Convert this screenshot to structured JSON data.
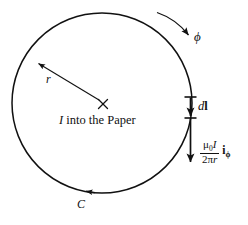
{
  "figure": {
    "background_color": "#ffffff",
    "stroke_color": "#111111",
    "labels": {
      "radius": "r",
      "phi": "ϕ",
      "contour": "C",
      "current_text_symbol": "I",
      "current_text_rest": " into the Paper",
      "dl_d": "d",
      "dl_l": "l",
      "formula_numerator_mu": "μ",
      "formula_numerator_mu_sub": "0",
      "formula_numerator_I": "I",
      "formula_denominator_two": "2",
      "formula_denominator_pi": "π",
      "formula_denominator_r": "r",
      "formula_unitvector": "i",
      "formula_unitvector_sub": "ϕ"
    },
    "geometry": {
      "circle_center_x": 102,
      "circle_center_y": 103,
      "circle_radius": 90,
      "center_cross_x": 103,
      "center_cross_y": 104,
      "radius_arrow_tip_x": 38,
      "radius_arrow_tip_y": 63,
      "dl_segment_top_y": 97,
      "dl_segment_bottom_y": 118,
      "field_arrow_top_y": 118,
      "field_arrow_bottom_y": 164,
      "right_edge_x": 191
    },
    "icons": {
      "center_mark": "cross-icon",
      "radius_arrow": "arrow-icon",
      "phi_arrow": "curved-arrow-icon",
      "contour_arrow": "arrow-icon",
      "dl_arrow": "arrow-icon",
      "field_arrow": "arrow-icon"
    }
  }
}
